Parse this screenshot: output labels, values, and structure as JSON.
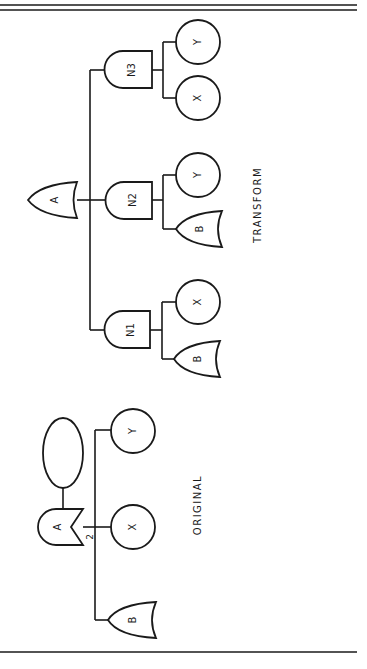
{
  "diagram": {
    "type": "fault-tree",
    "orientation": "rotated 90 degrees counter-clockwise",
    "colors": {
      "line": "#1a1a1a",
      "background": "#ffffff"
    },
    "transform": {
      "caption": "TRANSFORM",
      "top_gate": {
        "label": "A",
        "type": "OR"
      },
      "intermediate_gates": [
        {
          "label": "N1",
          "type": "AND",
          "children": [
            {
              "label": "X",
              "type": "basic-event"
            },
            {
              "label": "B",
              "type": "OR"
            }
          ]
        },
        {
          "label": "N2",
          "type": "AND",
          "children": [
            {
              "label": "Y",
              "type": "basic-event"
            },
            {
              "label": "B",
              "type": "OR"
            }
          ]
        },
        {
          "label": "N3",
          "type": "AND",
          "children": [
            {
              "label": "Y",
              "type": "basic-event"
            },
            {
              "label": "X",
              "type": "basic-event"
            }
          ]
        }
      ]
    },
    "original": {
      "caption": "ORIGINAL",
      "top_gate": {
        "label": "A",
        "type": "k-of-n voting gate",
        "k": "2"
      },
      "condition": {
        "label": "",
        "type": "ellipse"
      },
      "children": [
        {
          "label": "Y",
          "type": "basic-event"
        },
        {
          "label": "X",
          "type": "basic-event"
        },
        {
          "label": "B",
          "type": "OR"
        }
      ]
    }
  }
}
